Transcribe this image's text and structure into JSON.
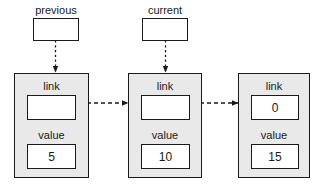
{
  "diagram": {
    "colors": {
      "node_fill": "#e9e9e9",
      "box_fill": "#ffffff",
      "stroke": "#1a1a1a"
    },
    "pointers": [
      {
        "name": "previous",
        "label": "previous",
        "value": "",
        "points_to": "node-1"
      },
      {
        "name": "current",
        "label": "current",
        "value": "",
        "points_to": "node-2"
      }
    ],
    "nodes": [
      {
        "id": "node-1",
        "link_label": "link",
        "link_value": "",
        "value_label": "value",
        "value_value": "5"
      },
      {
        "id": "node-2",
        "link_label": "link",
        "link_value": "",
        "value_label": "value",
        "value_value": "10"
      },
      {
        "id": "node-3",
        "link_label": "link",
        "link_value": "0",
        "value_label": "value",
        "value_value": "15"
      }
    ]
  }
}
